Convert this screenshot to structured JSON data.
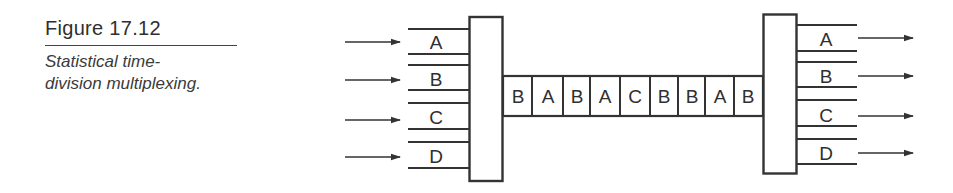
{
  "caption": {
    "figure_label": "Figure 17.12",
    "description": "Statistical time-division multiplexing."
  },
  "diagram": {
    "type": "statistical-tdm",
    "inputs": [
      "A",
      "B",
      "C",
      "D"
    ],
    "link_frames": [
      "B",
      "A",
      "B",
      "A",
      "C",
      "B",
      "B",
      "A",
      "B"
    ],
    "outputs": [
      "A",
      "B",
      "C",
      "D"
    ],
    "colors": {
      "stroke": "#333333",
      "text": "#2f2f2f",
      "background": "#ffffff"
    }
  }
}
